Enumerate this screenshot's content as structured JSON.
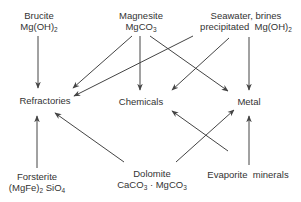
{
  "diagram": {
    "nodes": {
      "brucite": {
        "name": "Brucite",
        "formula_main": "Mg(OH)",
        "formula_sub": "2"
      },
      "magnesite": {
        "name": "Magnesite",
        "formula_main": "MgCO",
        "formula_sub": "3"
      },
      "seawater": {
        "name": "Seawater, brines",
        "line2_main": "precipitated  Mg(OH)",
        "line2_sub": "2"
      },
      "refractories": {
        "name": "Refractories"
      },
      "chemicals": {
        "name": "Chemicals"
      },
      "metal": {
        "name": "Metal"
      },
      "forsterite": {
        "name": "Forsterite",
        "f1": "(MgFe)",
        "f1_sub": "2",
        "f2": " SiO",
        "f2_sub": "4"
      },
      "dolomite": {
        "name": "Dolomite",
        "f1": "CaCO",
        "f1_sub": "3",
        "f2": " · MgCO",
        "f2_sub": "3"
      },
      "evaporite": {
        "name": "Evaporite  minerals"
      }
    },
    "edges": [
      {
        "from": "Brucite",
        "to": "Refractories"
      },
      {
        "from": "Magnesite",
        "to": "Refractories"
      },
      {
        "from": "Magnesite",
        "to": "Chemicals"
      },
      {
        "from": "Magnesite",
        "to": "Metal"
      },
      {
        "from": "Seawater, brines",
        "to": "Refractories"
      },
      {
        "from": "Seawater, brines",
        "to": "Chemicals"
      },
      {
        "from": "Seawater, brines",
        "to": "Metal"
      },
      {
        "from": "Forsterite",
        "to": "Refractories"
      },
      {
        "from": "Dolomite",
        "to": "Refractories"
      },
      {
        "from": "Dolomite",
        "to": "Metal"
      },
      {
        "from": "Evaporite minerals",
        "to": "Chemicals"
      },
      {
        "from": "Evaporite minerals",
        "to": "Metal"
      }
    ]
  }
}
